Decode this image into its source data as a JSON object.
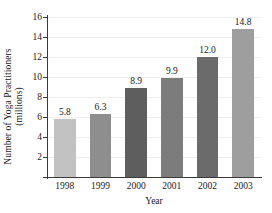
{
  "chart_data": {
    "type": "bar",
    "title": "",
    "xlabel": "Year",
    "ylabel_line1": "Number of Yoga Practitioners",
    "ylabel_line2": "(millions)",
    "categories": [
      "1998",
      "1999",
      "2000",
      "2001",
      "2002",
      "2003"
    ],
    "values": [
      5.8,
      6.3,
      8.9,
      9.9,
      12.0,
      14.8
    ],
    "value_labels": [
      "5.8",
      "6.3",
      "8.9",
      "9.9",
      "12.0",
      "14.8"
    ],
    "bar_colors": [
      "#c2c2c2",
      "#8e8e8e",
      "#5e5e5e",
      "#7c7c7c",
      "#6b6b6b",
      "#9e9e9e"
    ],
    "ylim": [
      0,
      16
    ],
    "yticks": [
      2,
      4,
      6,
      8,
      10,
      12,
      14,
      16
    ],
    "ytick_labels": [
      "2",
      "4",
      "6",
      "8",
      "10",
      "12",
      "14",
      "16"
    ],
    "grid": true,
    "grid_color": "#eeeeee",
    "legend": "none",
    "axis_color": "#3a3a3a",
    "background": "#ffffff"
  }
}
